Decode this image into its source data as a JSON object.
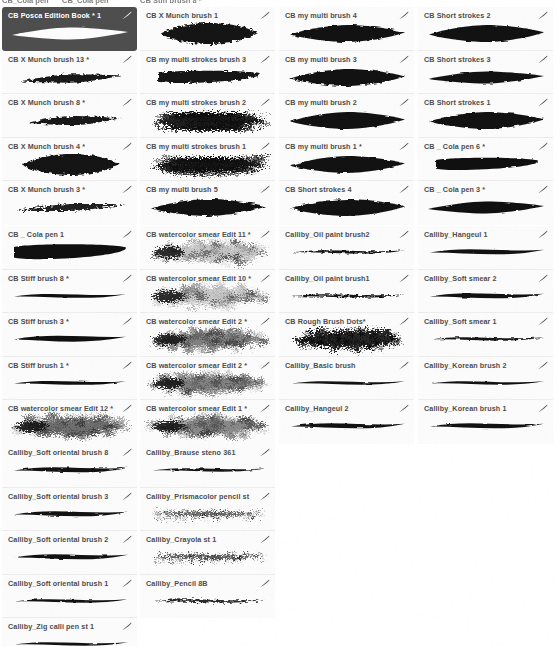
{
  "app": {
    "title": "Brush Library",
    "selected_brush": "CB Posca Edition Book * 1",
    "accent_selected_bg": "#4e4e4e",
    "card_bg": "#fbfbfb",
    "label_color": "#4d4d4d",
    "edit_icon_name": "brush-stroke-edit-icon"
  },
  "top_strip": {
    "clipped_labels": [
      "CB_Cola pen",
      "CB_Cola pen",
      "CB Stiff brush 8 *"
    ]
  },
  "groups": [
    {
      "id": "group-1",
      "top": 7,
      "columns": [
        {
          "id": "col-1-1",
          "left": 2,
          "items": [
            {
              "label": "CB Posca Edition Book * 1",
              "selected": true,
              "shape": "posca-leaf",
              "ink": 0.98,
              "rough": 0.05
            },
            {
              "label": "CB X Munch brush 13 *",
              "selected": false,
              "shape": "tapered-sweep",
              "ink": 0.95,
              "rough": 0.3
            },
            {
              "label": "CB X Munch brush 8 *",
              "selected": false,
              "shape": "tapered-wedge",
              "ink": 0.95,
              "rough": 0.3
            },
            {
              "label": "CB X Munch brush 4 *",
              "selected": false,
              "shape": "fat-blob",
              "ink": 0.97,
              "rough": 0.35
            },
            {
              "label": "CB X Munch brush 3 *",
              "selected": false,
              "shape": "thin-sweep",
              "ink": 0.92,
              "rough": 0.45
            }
          ]
        },
        {
          "id": "col-1-2",
          "left": 140,
          "items": [
            {
              "label": "CB X Munch brush 1",
              "selected": false,
              "shape": "fat-blob",
              "ink": 0.97,
              "rough": 0.4
            },
            {
              "label": "CB my multi strokes brush 3",
              "selected": false,
              "shape": "bar-slab",
              "ink": 0.96,
              "rough": 0.3
            },
            {
              "label": "CB my multi strokes brush 2",
              "selected": false,
              "shape": "hairy-multi",
              "ink": 0.95,
              "rough": 0.85
            },
            {
              "label": "CB my multi strokes brush 1",
              "selected": false,
              "shape": "hairy-multi",
              "ink": 0.94,
              "rough": 0.9
            },
            {
              "label": "CB my multi brush 5",
              "selected": false,
              "shape": "leaf-solid",
              "ink": 0.98,
              "rough": 0.2
            }
          ]
        },
        {
          "id": "col-1-3",
          "left": 279,
          "items": [
            {
              "label": "CB my multi brush 4",
              "selected": false,
              "shape": "leaf-solid",
              "ink": 0.98,
              "rough": 0.18
            },
            {
              "label": "CB my multi brush 3",
              "selected": false,
              "shape": "leaf-solid",
              "ink": 0.98,
              "rough": 0.22
            },
            {
              "label": "CB my multi brush 2",
              "selected": false,
              "shape": "leaf-solid",
              "ink": 0.98,
              "rough": 0.12
            },
            {
              "label": "CB my multi brush 1 *",
              "selected": false,
              "shape": "leaf-solid",
              "ink": 0.98,
              "rough": 0.14
            },
            {
              "label": "CB Short strokes 4",
              "selected": false,
              "shape": "leaf-solid",
              "ink": 0.98,
              "rough": 0.16
            }
          ]
        },
        {
          "id": "col-1-4",
          "left": 418,
          "items": [
            {
              "label": "CB Short strokes 2",
              "selected": false,
              "shape": "leaf-solid",
              "ink": 0.98,
              "rough": 0.14
            },
            {
              "label": "CB Short strokes 3",
              "selected": false,
              "shape": "posca-leaf",
              "ink": 0.98,
              "rough": 0.1
            },
            {
              "label": "CB Short strokes 1",
              "selected": false,
              "shape": "leaf-solid",
              "ink": 0.98,
              "rough": 0.15
            },
            {
              "label": "CB _ Cola pen 6 *",
              "selected": false,
              "shape": "bar-slab",
              "ink": 0.99,
              "rough": 0.08
            },
            {
              "label": "CB _ Cola pen 3 *",
              "selected": false,
              "shape": "posca-leaf",
              "ink": 0.99,
              "rough": 0.06
            }
          ]
        }
      ]
    },
    {
      "id": "group-2",
      "top": 226,
      "columns": [
        {
          "id": "col-2-1",
          "left": 2,
          "items": [
            {
              "label": "CB _ Cola pen 1",
              "selected": false,
              "shape": "cola-thick",
              "ink": 0.99,
              "rough": 0.06
            },
            {
              "label": "CB Stiff brush 8 *",
              "selected": false,
              "shape": "ribbon-thin",
              "ink": 0.99,
              "rough": 0.05
            },
            {
              "label": "CB Stiff brush 3 *",
              "selected": false,
              "shape": "ribbon-mid",
              "ink": 0.99,
              "rough": 0.05
            },
            {
              "label": "CB Stiff brush 1 *",
              "selected": false,
              "shape": "ribbon-thin",
              "ink": 0.99,
              "rough": 0.05
            },
            {
              "label": "CB watercolor smear Edit 12 *",
              "selected": false,
              "shape": "watercolor",
              "ink": 0.88,
              "rough": 0.95
            }
          ]
        },
        {
          "id": "col-2-2",
          "left": 140,
          "items": [
            {
              "label": "CB watercolor smear Edit 11 *",
              "selected": false,
              "shape": "watercolor-light",
              "ink": 0.55,
              "rough": 0.95
            },
            {
              "label": "CB watercolor smear Edit 10 *",
              "selected": false,
              "shape": "watercolor-light",
              "ink": 0.5,
              "rough": 0.95
            },
            {
              "label": "CB watercolor smear Edit 2 *",
              "selected": false,
              "shape": "watercolor",
              "ink": 0.72,
              "rough": 0.9
            },
            {
              "label": "CB watercolor smear Edit 2 *",
              "selected": false,
              "shape": "watercolor",
              "ink": 0.7,
              "rough": 0.9
            },
            {
              "label": "CB watercolor smear Edit 1 *",
              "selected": false,
              "shape": "watercolor",
              "ink": 0.68,
              "rough": 0.88
            }
          ]
        },
        {
          "id": "col-2-3",
          "left": 279,
          "items": [
            {
              "label": "Calliby_Oil paint brush2",
              "selected": false,
              "shape": "calli-thin",
              "ink": 0.96,
              "rough": 0.25
            },
            {
              "label": "Calliby_Oil paint brush1",
              "selected": false,
              "shape": "calli-thin",
              "ink": 0.96,
              "rough": 0.3
            },
            {
              "label": "CB Rough Brush Dots*",
              "selected": false,
              "shape": "rough-dots",
              "ink": 0.97,
              "rough": 0.98
            },
            {
              "label": "Calliby_Basic brush",
              "selected": false,
              "shape": "calli-thin",
              "ink": 0.98,
              "rough": 0.06
            },
            {
              "label": "Calliby_Hangeul 2",
              "selected": false,
              "shape": "calli-mid",
              "ink": 0.98,
              "rough": 0.1
            }
          ]
        },
        {
          "id": "col-2-4",
          "left": 418,
          "items": [
            {
              "label": "Calliby_Hangeul 1",
              "selected": false,
              "shape": "calli-mid",
              "ink": 0.98,
              "rough": 0.08
            },
            {
              "label": "Calliby_Soft smear 2",
              "selected": false,
              "shape": "calli-mid",
              "ink": 0.98,
              "rough": 0.1
            },
            {
              "label": "Calliby_Soft smear 1",
              "selected": false,
              "shape": "calli-thin",
              "ink": 0.96,
              "rough": 0.22
            },
            {
              "label": "Calliby_Korean brush 2",
              "selected": false,
              "shape": "calli-thin",
              "ink": 0.98,
              "rough": 0.07
            },
            {
              "label": "Calliby_Korean brush 1",
              "selected": false,
              "shape": "calli-mid",
              "ink": 0.98,
              "rough": 0.08
            }
          ]
        }
      ]
    },
    {
      "id": "group-3",
      "top": 444,
      "columns": [
        {
          "id": "col-3-1",
          "left": 2,
          "items": [
            {
              "label": "Calliby_Soft oriental brush 8",
              "selected": false,
              "shape": "calli-mid",
              "ink": 0.98,
              "rough": 0.12
            },
            {
              "label": "Calliby_Soft oriental brush 3",
              "selected": false,
              "shape": "calli-mid",
              "ink": 0.98,
              "rough": 0.14
            },
            {
              "label": "Calliby_Soft oriental brush 2",
              "selected": false,
              "shape": "calli-mid",
              "ink": 0.98,
              "rough": 0.1
            },
            {
              "label": "Calliby_Soft oriental brush 1",
              "selected": false,
              "shape": "calli-thin",
              "ink": 0.98,
              "rough": 0.12
            },
            {
              "label": "Calliby_Zig calli pen st 1",
              "selected": false,
              "shape": "calli-thin",
              "ink": 0.98,
              "rough": 0.06
            }
          ]
        },
        {
          "id": "col-3-2",
          "left": 140,
          "items": [
            {
              "label": "Calliby_Brause steno 361",
              "selected": false,
              "shape": "calli-thin",
              "ink": 0.97,
              "rough": 0.15
            },
            {
              "label": "Calliby_Prismacolor pencil st",
              "selected": false,
              "shape": "pencil-grain",
              "ink": 0.8,
              "rough": 0.85
            },
            {
              "label": "Calliby_Crayola st 1",
              "selected": false,
              "shape": "pencil-grain",
              "ink": 0.85,
              "rough": 0.8
            },
            {
              "label": "Calliby_Pencil 8B",
              "selected": false,
              "shape": "calli-thin",
              "ink": 0.88,
              "rough": 0.35
            }
          ]
        }
      ]
    }
  ]
}
